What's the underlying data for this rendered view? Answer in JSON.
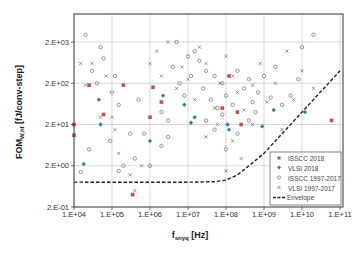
{
  "chart_data": {
    "type": "scatter",
    "title": "",
    "xlabel": "f",
    "xlabel_sub": "snyq",
    "xlabel_unit": " [Hz]",
    "ylabel": "FOM",
    "ylabel_sub": "W,hf",
    "ylabel_unit": " [fJ/conv-step]",
    "xscale": "log",
    "yscale": "log",
    "xlim": [
      10000.0,
      150000000000.0
    ],
    "ylim": [
      0.2,
      8000
    ],
    "grid": true,
    "legend_position": "lower right inside",
    "x_ticks": [
      {
        "value": 10000.0,
        "label": "1.E+04"
      },
      {
        "value": 100000.0,
        "label": "1.E+05"
      },
      {
        "value": 1000000.0,
        "label": "1.E+06"
      },
      {
        "value": 10000000.0,
        "label": "1.E+07"
      },
      {
        "value": 100000000.0,
        "label": "1.E+08"
      },
      {
        "value": 1000000000.0,
        "label": "1.E+09"
      },
      {
        "value": 10000000000.0,
        "label": "1.E+10"
      },
      {
        "value": 100000000000.0,
        "label": "1.E+11"
      }
    ],
    "y_ticks": [
      {
        "value": 0.2,
        "label": "2.E-01"
      },
      {
        "value": 2,
        "label": "2.E+00"
      },
      {
        "value": 20,
        "label": "2.E+01"
      },
      {
        "value": 200,
        "label": "2.E+02"
      },
      {
        "value": 2000,
        "label": "2.E+03"
      }
    ],
    "series": [
      {
        "name": "ISSCC 2018",
        "marker": "square-filled",
        "color": "#c0504d",
        "points": [
          [
            10000.0,
            20
          ],
          [
            10000.0,
            11
          ],
          [
            25000.0,
            180
          ],
          [
            60000.0,
            35
          ],
          [
            350000.0,
            0.4
          ],
          [
            200000.0,
            180
          ],
          [
            1200000.0,
            160
          ],
          [
            2000000.0,
            70
          ],
          [
            1000000.0,
            30
          ],
          [
            80000000.0,
            50
          ],
          [
            200000000.0,
            40
          ],
          [
            250000000.0,
            20
          ],
          [
            60000000000.0,
            25
          ],
          [
            120000000.0,
            300
          ]
        ]
      },
      {
        "name": "VLSI 2018",
        "marker": "diamond-filled",
        "color": "#31859c",
        "points": [
          [
            18000.0,
            2.2
          ],
          [
            45000.0,
            80
          ],
          [
            50000.0,
            20
          ],
          [
            1000000.0,
            8
          ],
          [
            2200000.0,
            100
          ],
          [
            15000000.0,
            30
          ],
          [
            120000000.0,
            15
          ],
          [
            900000000.0,
            18
          ],
          [
            1800000000.0,
            45
          ],
          [
            12000000000.0,
            40
          ],
          [
            110000000.0,
            20
          ],
          [
            12000000.0,
            22
          ],
          [
            8000000.0,
            60
          ]
        ]
      },
      {
        "name": "ISSCC 1997-2017",
        "marker": "circle-open",
        "color": "#555555",
        "points": [
          [
            20000.0,
            3000
          ],
          [
            30000.0,
            400
          ],
          [
            50000.0,
            1500
          ],
          [
            40000.0,
            200
          ],
          [
            60000.0,
            800
          ],
          [
            120000.0,
            300
          ],
          [
            150000.0,
            60
          ],
          [
            90000.0,
            8
          ],
          [
            200000.0,
            2
          ],
          [
            150000.0,
            1.5
          ],
          [
            400000.0,
            3
          ],
          [
            300000.0,
            12
          ],
          [
            1000000.0,
            2
          ],
          [
            2000000.0,
            40
          ],
          [
            3000000.0,
            10
          ],
          [
            4000000.0,
            500
          ],
          [
            5000000.0,
            2000
          ],
          [
            6000000.0,
            200
          ],
          [
            8000000.0,
            100
          ],
          [
            10000000.0,
            900
          ],
          [
            12000000.0,
            300
          ],
          [
            15000000.0,
            1200
          ],
          [
            20000000.0,
            700
          ],
          [
            25000000.0,
            150
          ],
          [
            30000000.0,
            400
          ],
          [
            40000000.0,
            80
          ],
          [
            50000000.0,
            300
          ],
          [
            60000000.0,
            50
          ],
          [
            80000000.0,
            200
          ],
          [
            100000000.0,
            100
          ],
          [
            150000000.0,
            60
          ],
          [
            200000000.0,
            400
          ],
          [
            300000000.0,
            150
          ],
          [
            400000000.0,
            250
          ],
          [
            500000000.0,
            70
          ],
          [
            700000000.0,
            120
          ],
          [
            1000000000.0,
            300
          ],
          [
            1500000000.0,
            90
          ],
          [
            2000000000.0,
            500
          ],
          [
            3000000000.0,
            60
          ],
          [
            5000000000.0,
            100
          ],
          [
            8000000000.0,
            250
          ],
          [
            10000000000.0,
            1500
          ],
          [
            20000000000.0,
            3000
          ],
          [
            30000000.0,
            25
          ],
          [
            50000000.0,
            15
          ],
          [
            80000000.0,
            35
          ],
          [
            100000000.0,
            5
          ],
          [
            200000000.0,
            12
          ],
          [
            400000000.0,
            25
          ],
          [
            600000000.0,
            40
          ],
          [
            2000000.0,
            6
          ],
          [
            700000.0,
            12
          ],
          [
            3000000.0,
            25
          ],
          [
            500000.0,
            80
          ],
          [
            100000.0,
            120
          ],
          [
            25000.0,
            5
          ],
          [
            15000.0,
            1.4
          ]
        ]
      },
      {
        "name": "VLSI 1997-2017",
        "marker": "x",
        "color": "#555555",
        "points": [
          [
            15000.0,
            600
          ],
          [
            20000.0,
            180
          ],
          [
            30000.0,
            600
          ],
          [
            50000.0,
            30
          ],
          [
            70000.0,
            300
          ],
          [
            100000.0,
            30
          ],
          [
            120000.0,
            15
          ],
          [
            150000.0,
            4
          ],
          [
            300000.0,
            1.2
          ],
          [
            400000.0,
            0.5
          ],
          [
            600000.0,
            2
          ],
          [
            1000000.0,
            600
          ],
          [
            1500000.0,
            1200
          ],
          [
            2000000.0,
            300
          ],
          [
            3000000.0,
            2000
          ],
          [
            5000000.0,
            150
          ],
          [
            7000000.0,
            500
          ],
          [
            10000000.0,
            250
          ],
          [
            15000000.0,
            80
          ],
          [
            20000000.0,
            1500
          ],
          [
            30000000.0,
            600
          ],
          [
            50000000.0,
            50
          ],
          [
            70000000.0,
            200
          ],
          [
            100000000.0,
            900
          ],
          [
            150000000.0,
            300
          ],
          [
            200000000.0,
            120
          ],
          [
            300000000.0,
            45
          ],
          [
            500000000.0,
            180
          ],
          [
            800000000.0,
            600
          ],
          [
            1200000000.0,
            70
          ],
          [
            2000000000.0,
            200
          ],
          [
            4000000000.0,
            1200
          ],
          [
            6000000000.0,
            80
          ],
          [
            10000000000.0,
            400
          ],
          [
            20000000000.0,
            150
          ],
          [
            30000000.0,
            10
          ],
          [
            60000000.0,
            20
          ],
          [
            150000000.0,
            8
          ],
          [
            250000000.0,
            3
          ],
          [
            100000000.0,
            1.5
          ],
          [
            500000000.0,
            20
          ],
          [
            3000000000.0,
            15
          ]
        ]
      },
      {
        "name": "Envelope",
        "marker": "dashed-line",
        "color": "#222222",
        "points": [
          [
            10000.0,
            0.8
          ],
          [
            100000.0,
            0.8
          ],
          [
            1000000.0,
            0.8
          ],
          [
            10000000.0,
            0.8
          ],
          [
            50000000.0,
            0.82
          ],
          [
            100000000.0,
            0.9
          ],
          [
            200000000.0,
            1.2
          ],
          [
            400000000.0,
            2
          ],
          [
            1000000000.0,
            4
          ],
          [
            3000000000.0,
            12
          ],
          [
            10000000000.0,
            40
          ],
          [
            30000000000.0,
            120
          ],
          [
            100000000000.0,
            400
          ],
          [
            150000000000.0,
            600
          ]
        ]
      }
    ]
  },
  "legend": {
    "items": [
      {
        "label": "ISSCC 2018"
      },
      {
        "label": "VLSI 2018"
      },
      {
        "label": "ISSCC 1997-2017"
      },
      {
        "label": "VLSI 1997-2017"
      },
      {
        "label": "Envelope"
      }
    ]
  }
}
